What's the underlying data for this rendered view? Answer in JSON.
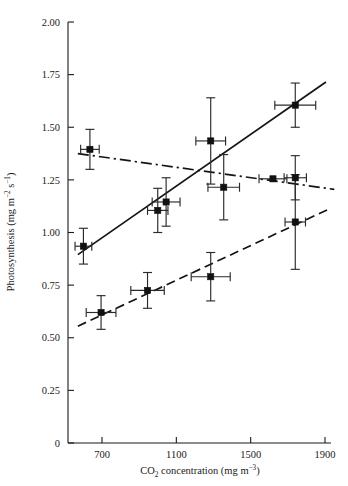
{
  "figure": {
    "name": "photosynthesis-vs-co2-scatter",
    "background": "#ffffff",
    "ink_color": "#1a1a1a"
  },
  "chart_data": {
    "type": "scatter",
    "title": "",
    "xlabel": "CO2 concentration (mg m-3)",
    "xlabel_parts": {
      "pre": "CO",
      "sub": "2",
      "mid": " concentration (mg m",
      "sup": "−3",
      "post": ")"
    },
    "ylabel": "Photosynthesis (mg m-2 s-1)",
    "ylabel_parts": {
      "pre": "Photosynthesis (mg m",
      "sup1": "−2",
      "mid": " s",
      "sup2": "−1",
      "post": ")"
    },
    "xlim": [
      540,
      1980
    ],
    "ylim": [
      0,
      2.0
    ],
    "grid": false,
    "legend": "none",
    "xticks": [
      700,
      1100,
      1500,
      1900
    ],
    "xtick_labels": [
      "700",
      "1100",
      "1500",
      "1900"
    ],
    "yticks": [
      0,
      0.25,
      0.5,
      0.75,
      1.0,
      1.25,
      1.5,
      1.75,
      2.0
    ],
    "ytick_labels": [
      "0",
      "0.25",
      "0.50",
      "0.75",
      "1.00",
      "1.25",
      "1.50",
      "1.75",
      "2.00"
    ],
    "marker": "filled-square",
    "error_bars": "both-x-and-y",
    "series": [
      {
        "name": "series-solid-increasing",
        "linestyle": "solid",
        "points": [
          {
            "x": 600,
            "y": 0.935,
            "xerr": 45,
            "yerr": 0.085
          },
          {
            "x": 1000,
            "y": 1.105,
            "xerr": 55,
            "yerr": 0.105
          },
          {
            "x": 1045,
            "y": 1.145,
            "xerr": 75,
            "yerr": 0.115
          },
          {
            "x": 1285,
            "y": 1.435,
            "xerr": 80,
            "yerr": 0.205
          },
          {
            "x": 1355,
            "y": 1.215,
            "xerr": 85,
            "yerr": 0.155
          },
          {
            "x": 1740,
            "y": 1.605,
            "xerr": 110,
            "yerr": 0.105
          }
        ],
        "fit_endpoints": [
          {
            "x": 570,
            "y": 0.895
          },
          {
            "x": 1905,
            "y": 1.715
          }
        ]
      },
      {
        "name": "series-dashdot-decreasing",
        "linestyle": "dash-dot",
        "points": [
          {
            "x": 635,
            "y": 1.395,
            "xerr": 50,
            "yerr": 0.095
          },
          {
            "x": 1620,
            "y": 1.255,
            "xerr": 75,
            "yerr": 0.0
          },
          {
            "x": 1740,
            "y": 1.26,
            "xerr": 60,
            "yerr": 0.105
          }
        ],
        "fit_endpoints": [
          {
            "x": 570,
            "y": 1.375
          },
          {
            "x": 1950,
            "y": 1.205
          }
        ]
      },
      {
        "name": "series-dashed-increasing",
        "linestyle": "dashed",
        "points": [
          {
            "x": 695,
            "y": 0.62,
            "xerr": 80,
            "yerr": 0.08
          },
          {
            "x": 945,
            "y": 0.725,
            "xerr": 90,
            "yerr": 0.085
          },
          {
            "x": 1285,
            "y": 0.79,
            "xerr": 105,
            "yerr": 0.115
          },
          {
            "x": 1740,
            "y": 1.05,
            "xerr": 55,
            "yerr": 0.225
          }
        ],
        "fit_endpoints": [
          {
            "x": 570,
            "y": 0.555
          },
          {
            "x": 1930,
            "y": 1.115
          }
        ]
      }
    ]
  }
}
